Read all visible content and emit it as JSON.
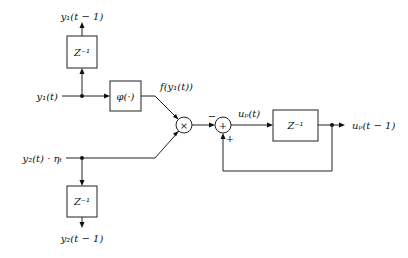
{
  "diagram": {
    "type": "block-diagram",
    "inputs": {
      "y1": "y₁(t)",
      "y2": "y₂(t) · ηₜ"
    },
    "outputs": {
      "y1_delayed": "y₁(t − 1)",
      "y2_delayed": "y₂(t − 1)",
      "up_delayed": "uₚ(t − 1)"
    },
    "blocks": {
      "delay_top": "Z⁻¹",
      "phi": "φ(·)",
      "delay_bottom": "Z⁻¹",
      "delay_right": "Z⁻¹"
    },
    "operators": {
      "multiply": "×",
      "sum": "+"
    },
    "signals": {
      "f_y1": "f(y₁(t))",
      "up": "uₚ(t)"
    },
    "signs": {
      "minus": "−",
      "plus": "+"
    }
  }
}
